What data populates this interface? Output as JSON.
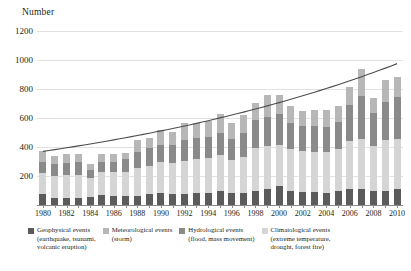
{
  "axis_title": "Number",
  "colors": {
    "geophysical": "#5b5b5b",
    "meteorological": "#b7b7b7",
    "hydrological": "#8a8a8a",
    "climatological": "#d5d5d5",
    "trendline": "#4d4d4d",
    "gridline": "#e3e1df",
    "axis": "#8b8b8b",
    "text": "#231f20"
  },
  "y_axis": {
    "labels": [
      "1200",
      "1000",
      "800",
      "600",
      "400",
      "200"
    ],
    "values": [
      1200,
      1000,
      800,
      600,
      400,
      200
    ],
    "min": 0,
    "max": 1200
  },
  "x_axis": {
    "tick_labels": [
      "1980",
      "1982",
      "1984",
      "1986",
      "1988",
      "1990",
      "1992",
      "1994",
      "1996",
      "1998",
      "2000",
      "2002",
      "2004",
      "2006",
      "2008",
      "2010"
    ]
  },
  "legend": [
    {
      "label": "Geophysical events",
      "sub": "(earthquake, tsunami,",
      "sub2": "volcanic eruption)",
      "color": "#5b5b5b",
      "key": "geophysical"
    },
    {
      "label": "Meteorological events",
      "sub": "(storm)",
      "sub2": "",
      "color": "#b7b7b7",
      "key": "meteorological"
    },
    {
      "label": "Hydrological events",
      "sub": "(flood, mass movement)",
      "sub2": "",
      "color": "#8a8a8a",
      "key": "hydrological"
    },
    {
      "label": "Climatological events",
      "sub": "(extreme temperature,",
      "sub2": "drought, forest fire)",
      "color": "#d5d5d5",
      "key": "climatological"
    }
  ],
  "chart_data": {
    "type": "bar",
    "title": "",
    "ylabel": "Number",
    "xlabel": "",
    "ylim": [
      0,
      1200
    ],
    "grid": true,
    "stacked": true,
    "legend_position": "bottom",
    "categories": [
      "1980",
      "1981",
      "1982",
      "1983",
      "1984",
      "1985",
      "1986",
      "1987",
      "1988",
      "1989",
      "1990",
      "1991",
      "1992",
      "1993",
      "1994",
      "1995",
      "1996",
      "1997",
      "1998",
      "1999",
      "2000",
      "2001",
      "2002",
      "2003",
      "2004",
      "2005",
      "2006",
      "2007",
      "2008",
      "2009",
      "2010"
    ],
    "series": [
      {
        "name": "Geophysical events",
        "color": "#5b5b5b",
        "values": [
          75,
          50,
          45,
          45,
          55,
          70,
          60,
          65,
          65,
          75,
          85,
          75,
          75,
          85,
          85,
          95,
          85,
          80,
          100,
          110,
          130,
          95,
          90,
          90,
          85,
          95,
          110,
          110,
          95,
          95,
          110
        ]
      },
      {
        "name": "Climatological events",
        "color": "#d5d5d5",
        "values": [
          145,
          150,
          160,
          165,
          130,
          155,
          165,
          160,
          190,
          195,
          210,
          215,
          230,
          230,
          240,
          250,
          225,
          250,
          290,
          300,
          285,
          290,
          280,
          275,
          280,
          290,
          330,
          345,
          310,
          350,
          345
        ]
      },
      {
        "name": "Hydrological events",
        "color": "#8a8a8a",
        "values": [
          75,
          80,
          85,
          85,
          60,
          70,
          75,
          90,
          110,
          120,
          120,
          125,
          140,
          150,
          145,
          155,
          145,
          165,
          195,
          200,
          210,
          180,
          175,
          180,
          175,
          185,
          250,
          300,
          230,
          265,
          290
        ]
      },
      {
        "name": "Meteorological events",
        "color": "#b7b7b7",
        "values": [
          80,
          60,
          60,
          60,
          35,
          55,
          55,
          45,
          85,
          70,
          100,
          90,
          120,
          100,
          110,
          125,
          110,
          125,
          120,
          150,
          135,
          115,
          105,
          110,
          115,
          110,
          125,
          180,
          100,
          150,
          140
        ]
      }
    ],
    "trendline": {
      "name": "trend",
      "color": "#4d4d4d",
      "start_value": 370,
      "end_value": 975,
      "points": [
        370,
        384,
        399,
        415,
        431,
        448,
        466,
        484,
        503,
        523,
        543,
        565,
        587,
        610,
        633,
        658,
        683,
        709,
        736,
        764,
        792,
        821,
        851,
        882,
        913,
        945,
        975,
        1000,
        1020,
        1035,
        975
      ]
    }
  }
}
